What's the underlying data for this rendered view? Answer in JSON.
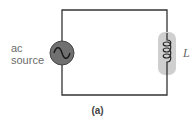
{
  "diagram": {
    "source": {
      "label_line1": "ac",
      "label_line2": "source",
      "icon": "ac-source-icon"
    },
    "inductor": {
      "label": "L",
      "icon": "inductor-coil-icon"
    },
    "caption": "(a)",
    "colors": {
      "wire": "#333333",
      "source_fill": "#707070",
      "inductor_highlight": "#cfcfcf",
      "label": "#6b6b6b"
    }
  }
}
